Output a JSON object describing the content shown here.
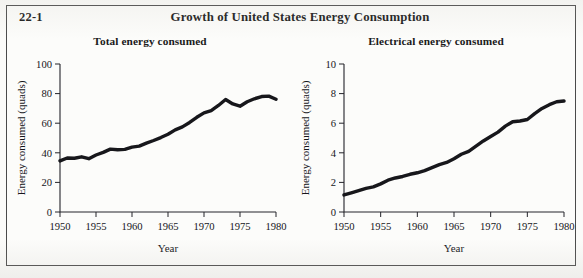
{
  "figure": {
    "number": "22-1",
    "title": "Growth of United States Energy Consumption"
  },
  "chart_data": [
    {
      "type": "line",
      "title": "Total energy consumed",
      "xlabel": "Year",
      "ylabel": "Energy consumed (quads)",
      "xlim": [
        1950,
        1980
      ],
      "ylim": [
        0,
        100
      ],
      "xticks": [
        1950,
        1955,
        1960,
        1965,
        1970,
        1975,
        1980
      ],
      "yticks": [
        0,
        20,
        40,
        60,
        80,
        100
      ],
      "xtick_labels": [
        "1950",
        "1955",
        "1960",
        "1965",
        "1970",
        "1975",
        "1980"
      ],
      "ytick_labels": [
        "0",
        "20",
        "40",
        "60",
        "80",
        "100"
      ],
      "grid": false,
      "legend": "none",
      "series": [
        {
          "name": "Total energy consumed",
          "x": [
            1950,
            1951,
            1952,
            1953,
            1954,
            1955,
            1956,
            1957,
            1958,
            1959,
            1960,
            1961,
            1962,
            1963,
            1964,
            1965,
            1966,
            1967,
            1968,
            1969,
            1970,
            1971,
            1972,
            1973,
            1974,
            1975,
            1976,
            1977,
            1978,
            1979,
            1980
          ],
          "values": [
            34.5,
            36.5,
            36.3,
            37.3,
            36.0,
            38.5,
            40.3,
            42.5,
            42.1,
            42.3,
            43.8,
            44.5,
            46.5,
            48.3,
            50.3,
            52.5,
            55.5,
            57.5,
            60.5,
            64.0,
            67.0,
            68.5,
            72.0,
            76.0,
            73.0,
            71.5,
            74.5,
            76.5,
            78.0,
            78.3,
            76.2
          ]
        }
      ]
    },
    {
      "type": "line",
      "title": "Electrical energy consumed",
      "xlabel": "Year",
      "ylabel": "Energy consumed (quads)",
      "xlim": [
        1950,
        1980
      ],
      "ylim": [
        0,
        10
      ],
      "xticks": [
        1950,
        1955,
        1960,
        1965,
        1970,
        1975,
        1980
      ],
      "yticks": [
        0,
        2,
        4,
        6,
        8,
        10
      ],
      "xtick_labels": [
        "1950",
        "1955",
        "1960",
        "1965",
        "1970",
        "1975",
        "1980"
      ],
      "ytick_labels": [
        "0",
        "2",
        "4",
        "6",
        "8",
        "10"
      ],
      "grid": false,
      "legend": "none",
      "series": [
        {
          "name": "Electrical energy consumed",
          "x": [
            1950,
            1951,
            1952,
            1953,
            1954,
            1955,
            1956,
            1957,
            1958,
            1959,
            1960,
            1961,
            1962,
            1963,
            1964,
            1965,
            1966,
            1967,
            1968,
            1969,
            1970,
            1971,
            1972,
            1973,
            1974,
            1975,
            1976,
            1977,
            1978,
            1979,
            1980
          ],
          "values": [
            1.15,
            1.3,
            1.45,
            1.6,
            1.7,
            1.9,
            2.15,
            2.3,
            2.4,
            2.55,
            2.65,
            2.8,
            3.0,
            3.2,
            3.35,
            3.6,
            3.9,
            4.1,
            4.45,
            4.8,
            5.1,
            5.4,
            5.8,
            6.1,
            6.15,
            6.25,
            6.65,
            7.0,
            7.25,
            7.45,
            7.5
          ]
        }
      ]
    }
  ]
}
